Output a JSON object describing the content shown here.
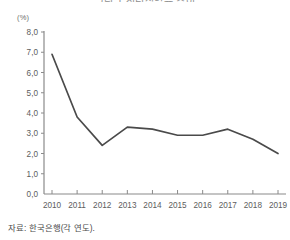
{
  "chart_data": {
    "type": "line",
    "title": "그림 1 청년실업률 추이",
    "unit_label": "(%)",
    "xlabel": "",
    "ylabel": "",
    "categories": [
      "2010",
      "2011",
      "2012",
      "2013",
      "2014",
      "2015",
      "2016",
      "2017",
      "2018",
      "2019"
    ],
    "values": [
      6.9,
      3.8,
      2.4,
      3.3,
      3.2,
      2.9,
      2.9,
      3.2,
      2.7,
      2.0
    ],
    "series": [
      {
        "name": "",
        "values": [
          6.9,
          3.8,
          2.4,
          3.3,
          3.2,
          2.9,
          2.9,
          3.2,
          2.7,
          2.0
        ]
      }
    ],
    "ylim": [
      0.0,
      8.0
    ],
    "ytick_labels": [
      "8,0",
      "7,0",
      "6,0",
      "5,0",
      "4,0",
      "3,0",
      "2,0",
      "1,0",
      "0,0"
    ],
    "ytick_values": [
      8.0,
      7.0,
      6.0,
      5.0,
      4.0,
      3.0,
      2.0,
      1.0,
      0.0
    ],
    "grid": false,
    "legend_position": "none",
    "line_color": "#4a4a4a",
    "axis_color": "#8a8a8a",
    "annotations": []
  },
  "source": {
    "note": "자료: 한국은행(각 연도)."
  }
}
